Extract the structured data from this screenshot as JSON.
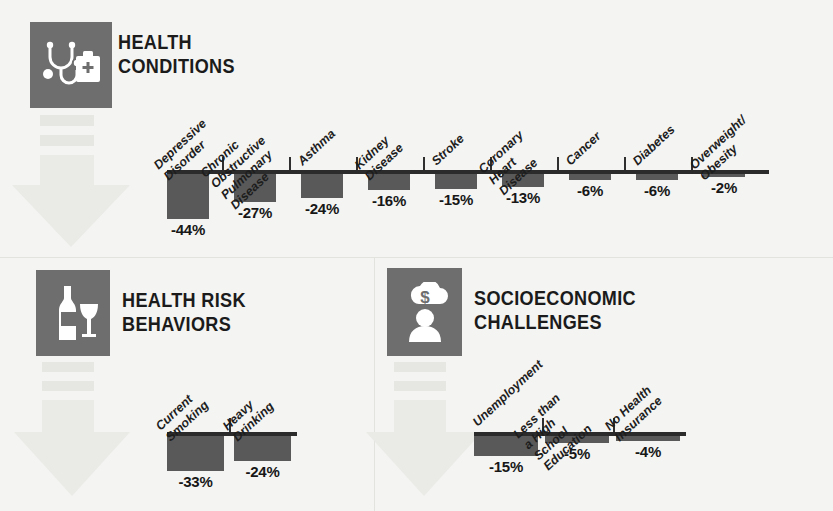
{
  "figure": {
    "background_color": "#f4f4f2",
    "bar_color": "#595959",
    "icon_tile_color": "#6e6e6e",
    "axis_color": "#2b2b2b",
    "watermark_color": "#eaeae7"
  },
  "sections": [
    {
      "id": "health-conditions",
      "title": "HEALTH\nCONDITIONS",
      "icon": "stethoscope-first-aid-kit-icon",
      "watermark": "down-arrow-watermark"
    },
    {
      "id": "health-risk-behaviors",
      "title": "HEALTH RISK\nBEHAVIORS",
      "icon": "wine-bottle-glass-icon",
      "watermark": "down-arrow-watermark"
    },
    {
      "id": "socioeconomic-challenges",
      "title": "SOCIOECONOMIC\nCHALLENGES",
      "icon": "person-money-thought-icon",
      "watermark": "down-arrow-watermark"
    }
  ],
  "chart_data": [
    {
      "id": "health-conditions",
      "type": "bar",
      "title": "HEALTH CONDITIONS",
      "xlabel": "",
      "ylabel": "",
      "ylim": [
        -44,
        0
      ],
      "grid": false,
      "legend": false,
      "orientation": "vertical-negative",
      "categories": [
        "Depressive Disorder",
        "Chronic Obstructive\nPulmonary Disease",
        "Asthma",
        "Kidney Disease",
        "Stroke",
        "Coronary Heart Disease",
        "Cancer",
        "Diabetes",
        "Overweight/\nObesity"
      ],
      "values": [
        -44,
        -27,
        -24,
        -16,
        -15,
        -13,
        -6,
        -6,
        -2
      ],
      "data_labels": [
        "-44%",
        "-27%",
        "-24%",
        "-16%",
        "-15%",
        "-13%",
        "-6%",
        "-6%",
        "-2%"
      ]
    },
    {
      "id": "health-risk-behaviors",
      "type": "bar",
      "title": "HEALTH RISK BEHAVIORS",
      "xlabel": "",
      "ylabel": "",
      "ylim": [
        -33,
        0
      ],
      "grid": false,
      "legend": false,
      "orientation": "vertical-negative",
      "categories": [
        "Current Smoking",
        "Heavy Drinking"
      ],
      "values": [
        -33,
        -24
      ],
      "data_labels": [
        "-33%",
        "-24%"
      ]
    },
    {
      "id": "socioeconomic-challenges",
      "type": "bar",
      "title": "SOCIOECONOMIC CHALLENGES",
      "xlabel": "",
      "ylabel": "",
      "ylim": [
        -15,
        0
      ],
      "grid": false,
      "legend": false,
      "orientation": "vertical-negative",
      "categories": [
        "Unemployment",
        "Less than a High School\nEducation",
        "No Health Insurance"
      ],
      "values": [
        -15,
        -5,
        -4
      ],
      "data_labels": [
        "-15%",
        "-5%",
        "-4%"
      ]
    }
  ]
}
